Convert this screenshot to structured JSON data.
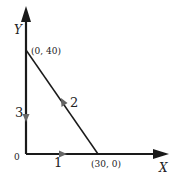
{
  "diagram": {
    "axes": {
      "x_label": "X",
      "y_label": "Y",
      "origin_label": "0"
    },
    "points": [
      {
        "label": "(0, 40)",
        "x": 0,
        "y": 40
      },
      {
        "label": "(30, 0)",
        "x": 30,
        "y": 0
      }
    ],
    "paths": [
      {
        "label": "1",
        "from": "(0, 0)",
        "to": "(30, 0)",
        "direction": "right"
      },
      {
        "label": "2",
        "from": "(30, 0)",
        "to": "(0, 40)",
        "direction": "up-left"
      },
      {
        "label": "3",
        "from": "(0, 40)",
        "to": "(0, 0)",
        "direction": "down"
      }
    ],
    "colors": {
      "line": "#1a1a1a",
      "text": "#222222",
      "path_arrow": "#555555"
    }
  }
}
